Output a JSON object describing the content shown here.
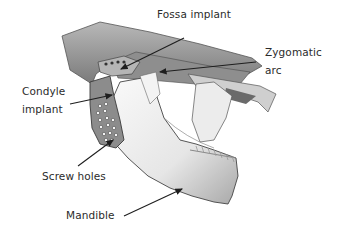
{
  "figure": {
    "labels": {
      "fossa_implant": "Fossa implant",
      "zygomatic_arc_line1": "Zygomatic",
      "zygomatic_arc_line2": "arc",
      "condyle_implant_line1": "Condyle",
      "condyle_implant_line2": "implant",
      "screw_holes": "Screw holes",
      "mandible": "Mandible"
    },
    "colors": {
      "background": "#ffffff",
      "label_text": "#2b2b2b",
      "arrow": "#1e1e1e",
      "bone_light": "#f2f2f2",
      "bone_shadow": "#9a9a9a",
      "implant_gray": "#8c8c8c"
    }
  }
}
